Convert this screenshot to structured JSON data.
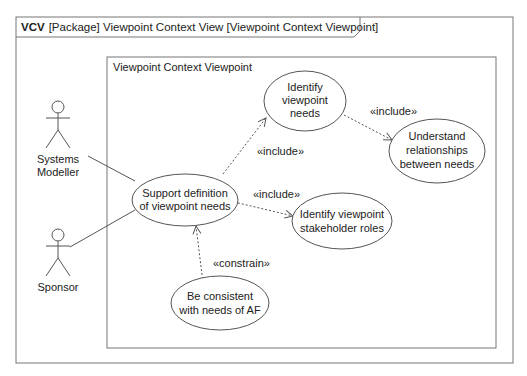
{
  "frame": {
    "kind_label": "VCV",
    "title": "[Package] Viewpoint Context View [Viewpoint Context Viewpoint]"
  },
  "boundary": {
    "label": "Viewpoint Context Viewpoint"
  },
  "actors": [
    {
      "id": "systems-modeller",
      "name_line1": "Systems",
      "name_line2": "Modeller"
    },
    {
      "id": "sponsor",
      "name_line1": "Sponsor"
    }
  ],
  "use_cases": [
    {
      "id": "support",
      "line1": "Support definition",
      "line2": "of viewpoint needs"
    },
    {
      "id": "identify-needs",
      "line1": "Identify",
      "line2": "viewpoint",
      "line3": "needs"
    },
    {
      "id": "understand",
      "line1": "Understand",
      "line2": "relationships",
      "line3": "between needs"
    },
    {
      "id": "stakeholders",
      "line1": "Identify viewpoint",
      "line2": "stakeholder roles"
    },
    {
      "id": "consistent",
      "line1": "Be consistent",
      "line2": "with needs of AF"
    }
  ],
  "relationships": [
    {
      "from": "support",
      "to": "identify-needs",
      "stereotype": "«include»"
    },
    {
      "from": "identify-needs",
      "to": "understand",
      "stereotype": "«include»"
    },
    {
      "from": "support",
      "to": "stakeholders",
      "stereotype": "«include»"
    },
    {
      "from": "consistent",
      "to": "support",
      "stereotype": "«constrain»"
    }
  ],
  "colors": {
    "line": "#555555",
    "text": "#222222",
    "background": "#ffffff"
  }
}
